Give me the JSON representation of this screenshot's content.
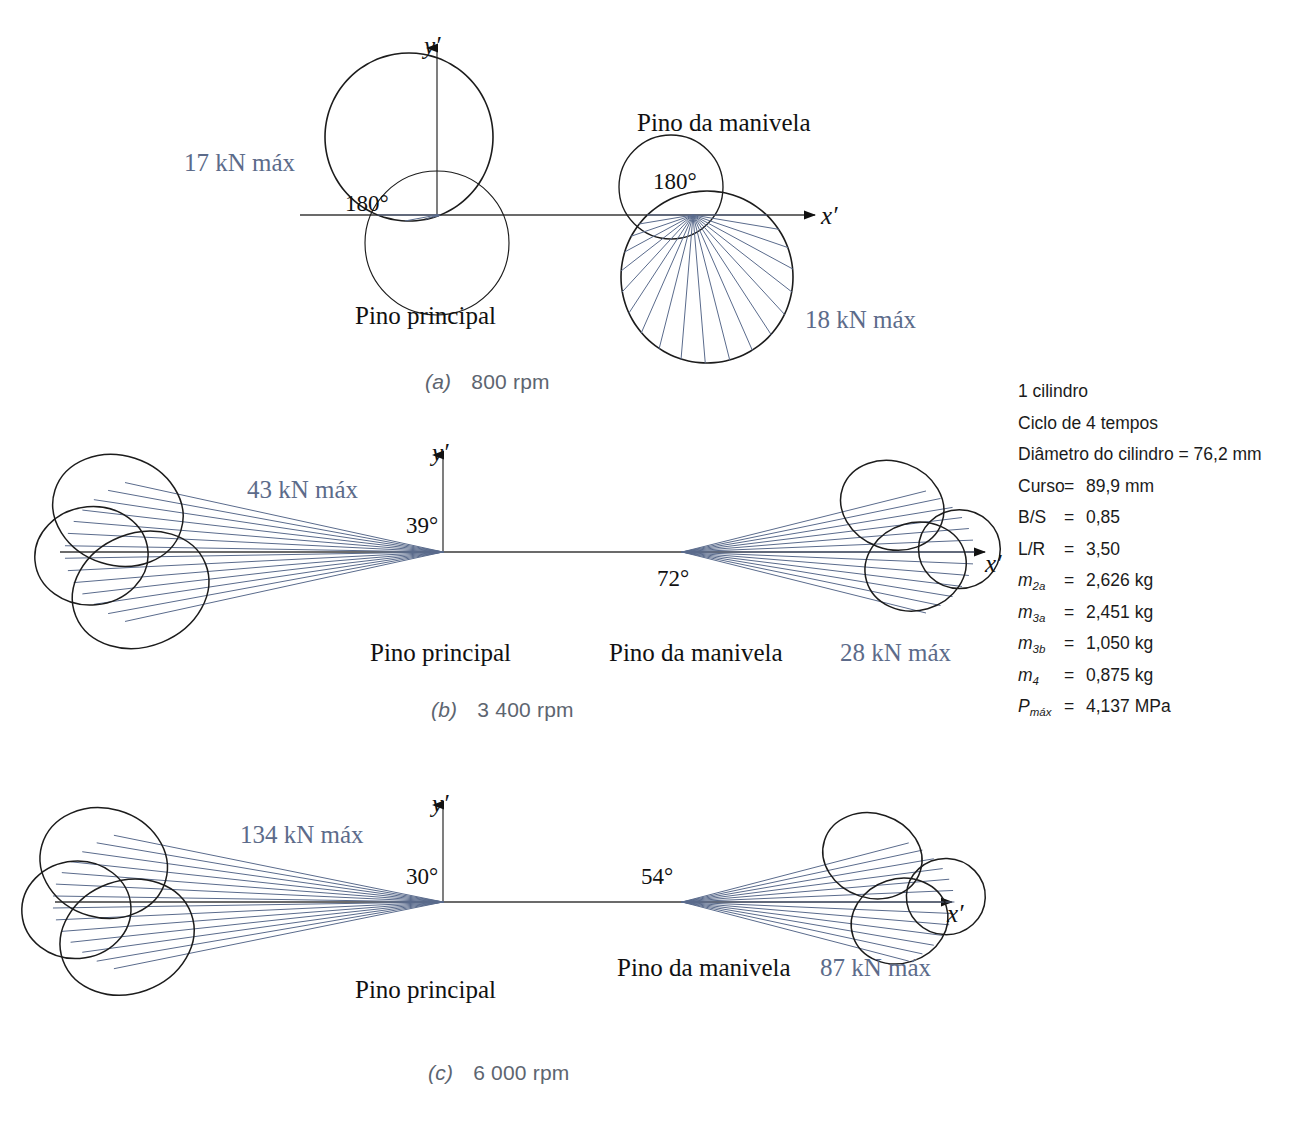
{
  "colors": {
    "ray": "#5a6b8c",
    "envelope": "#1c1c1c",
    "axis": "#3a3a3a",
    "kn_text": "#5c6b8a",
    "caption_text": "#5d6570",
    "body_text": "#111111",
    "background": "#ffffff"
  },
  "panels": [
    {
      "id": "a",
      "caption_letter": "(a)",
      "caption_value": "800 rpm",
      "main_pin": {
        "name": "Pino principal",
        "angle": "180°",
        "max_load": "17 kN máx"
      },
      "crank_pin": {
        "name": "Pino da manivela",
        "angle": "180°",
        "max_load": "18 kN máx"
      },
      "axis_y": "y′",
      "axis_x": "x′"
    },
    {
      "id": "b",
      "caption_letter": "(b)",
      "caption_value": "3 400 rpm",
      "main_pin": {
        "name": "Pino principal",
        "angle": "39°",
        "max_load": "43 kN máx"
      },
      "crank_pin": {
        "name": "Pino da manivela",
        "angle": "72°",
        "max_load": "28 kN máx"
      },
      "axis_y": "y′",
      "axis_x": "x′"
    },
    {
      "id": "c",
      "caption_letter": "(c)",
      "caption_value": "6 000 rpm",
      "main_pin": {
        "name": "Pino principal",
        "angle": "30°",
        "max_load": "134 kN máx"
      },
      "crank_pin": {
        "name": "Pino da manivela",
        "angle": "54°",
        "max_load": "87 kN máx"
      },
      "axis_y": "y′",
      "axis_x": "x′"
    }
  ],
  "parameters": {
    "line1": "1 cilindro",
    "line2": "Ciclo de 4 tempos",
    "line3": "Diâmetro do cilindro =  76,2 mm",
    "rows": [
      {
        "symbol": "Curso",
        "sub": "",
        "eq": "=",
        "value": "89,9 mm"
      },
      {
        "symbol": "B/S",
        "sub": "",
        "eq": "=",
        "value": "0,85"
      },
      {
        "symbol": "L/R",
        "sub": "",
        "eq": "=",
        "value": "3,50"
      },
      {
        "symbol": "m",
        "sub": "2a",
        "eq": "=",
        "value": "2,626 kg"
      },
      {
        "symbol": "m",
        "sub": "3a",
        "eq": "=",
        "value": "2,451 kg"
      },
      {
        "symbol": "m",
        "sub": "3b",
        "eq": "=",
        "value": "1,050 kg"
      },
      {
        "symbol": "m",
        "sub": "4",
        "eq": "=",
        "value": "0,875 kg"
      },
      {
        "symbol": "P",
        "sub": "máx",
        "eq": "=",
        "value": "4,137 MPa"
      }
    ]
  },
  "chart_data": {
    "type": "scatter",
    "xlabel": "x′",
    "ylabel": "y′",
    "grid": false,
    "legend": null,
    "series": [
      {
        "name": "(a) 800 rpm — Pino principal",
        "max_load_kN": 17,
        "crank_angle_marker_deg": 180
      },
      {
        "name": "(a) 800 rpm — Pino da manivela",
        "max_load_kN": 18,
        "crank_angle_marker_deg": 180
      },
      {
        "name": "(b) 3400 rpm — Pino principal",
        "max_load_kN": 43,
        "crank_angle_marker_deg": 39
      },
      {
        "name": "(b) 3400 rpm — Pino da manivela",
        "max_load_kN": 28,
        "crank_angle_marker_deg": 72
      },
      {
        "name": "(c) 6000 rpm — Pino principal",
        "max_load_kN": 134,
        "crank_angle_marker_deg": 30
      },
      {
        "name": "(c) 6000 rpm — Pino da manivela",
        "max_load_kN": 87,
        "crank_angle_marker_deg": 54
      }
    ],
    "speeds_rpm": [
      800,
      3400,
      6000
    ],
    "engine": {
      "cylinders": 1,
      "cycle_strokes": 4,
      "bore_mm": 76.2,
      "stroke_mm": 89.9,
      "bore_over_stroke": 0.85,
      "rod_over_crank": 3.5,
      "m2a_kg": 2.626,
      "m3a_kg": 2.451,
      "m3b_kg": 1.05,
      "m4_kg": 0.875,
      "pmax_MPa": 4.137
    }
  }
}
